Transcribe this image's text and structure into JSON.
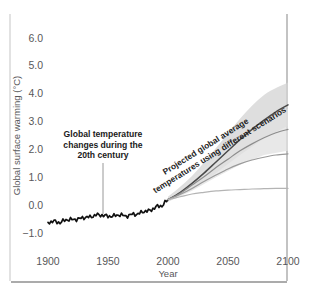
{
  "chart_data": {
    "type": "line",
    "title": "",
    "xlabel": "Year",
    "ylabel": "Global surface warming (°C)",
    "xlim": [
      1900,
      2100
    ],
    "ylim": [
      -1.0,
      6.0
    ],
    "xticks": [
      "1900",
      "1950",
      "2000",
      "2050",
      "2100"
    ],
    "yticks": [
      "6.0",
      "5.0",
      "4.0",
      "3.0",
      "2.0",
      "1.0",
      "0.0",
      "−1.0"
    ],
    "grid": false,
    "legend": "none",
    "annotations": [
      {
        "name": "historical-annotation",
        "line1": "Global temperature",
        "line2": "changes during the",
        "line3": "20th century",
        "pointer_year": 1945,
        "pointer_value": -0.35
      },
      {
        "name": "projection-annotation",
        "line1": "Projected global average",
        "line2": "temperatures using different scenarios",
        "rotation_deg": -32
      }
    ],
    "series": [
      {
        "name": "Observed 20th century",
        "color": "#111111",
        "width": 1.7,
        "x": [
          1900,
          1905,
          1910,
          1915,
          1920,
          1925,
          1930,
          1935,
          1940,
          1945,
          1950,
          1955,
          1960,
          1965,
          1970,
          1975,
          1980,
          1985,
          1990,
          1995,
          2000
        ],
        "values": [
          -0.62,
          -0.58,
          -0.63,
          -0.52,
          -0.52,
          -0.5,
          -0.44,
          -0.43,
          -0.35,
          -0.36,
          -0.4,
          -0.39,
          -0.34,
          -0.4,
          -0.33,
          -0.32,
          -0.22,
          -0.2,
          -0.06,
          -0.02,
          0.2
        ]
      },
      {
        "name": "High scenario (A2/A1FI)",
        "color": "#4a4a4a",
        "width": 1.5,
        "x": [
          2000,
          2010,
          2020,
          2030,
          2040,
          2050,
          2060,
          2070,
          2080,
          2090,
          2100
        ],
        "values": [
          0.2,
          0.45,
          0.78,
          1.15,
          1.55,
          1.95,
          2.35,
          2.72,
          3.05,
          3.35,
          3.6
        ]
      },
      {
        "name": "Mid-high scenario (A1B)",
        "color": "#8d8d8d",
        "width": 1.2,
        "x": [
          2000,
          2010,
          2020,
          2030,
          2040,
          2050,
          2060,
          2070,
          2080,
          2090,
          2100
        ],
        "values": [
          0.2,
          0.42,
          0.72,
          1.02,
          1.35,
          1.65,
          1.95,
          2.2,
          2.42,
          2.6,
          2.72
        ]
      },
      {
        "name": "Mid-low scenario (B1)",
        "color": "#9a9a9a",
        "width": 1.2,
        "x": [
          2000,
          2010,
          2020,
          2030,
          2040,
          2050,
          2060,
          2070,
          2080,
          2090,
          2100
        ],
        "values": [
          0.2,
          0.38,
          0.6,
          0.85,
          1.08,
          1.3,
          1.48,
          1.62,
          1.72,
          1.8,
          1.84
        ]
      },
      {
        "name": "Constant composition commitment",
        "color": "#b4b4b4",
        "width": 1.2,
        "x": [
          2000,
          2010,
          2020,
          2030,
          2040,
          2050,
          2060,
          2070,
          2080,
          2090,
          2100
        ],
        "values": [
          0.2,
          0.3,
          0.4,
          0.46,
          0.51,
          0.54,
          0.56,
          0.58,
          0.59,
          0.6,
          0.6
        ]
      }
    ],
    "uncertainty_bands": [
      {
        "name": "High scenario range",
        "color": "#d3d3d3",
        "x": [
          2000,
          2020,
          2040,
          2060,
          2080,
          2100
        ],
        "upper": [
          0.3,
          1.05,
          2.05,
          3.1,
          3.95,
          4.4
        ],
        "lower": [
          0.12,
          0.55,
          1.15,
          1.8,
          2.4,
          2.85
        ]
      },
      {
        "name": "Mid scenario range",
        "color": "#e0e0e0",
        "x": [
          2000,
          2020,
          2040,
          2060,
          2080,
          2100
        ],
        "upper": [
          0.28,
          0.92,
          1.72,
          2.5,
          3.1,
          3.45
        ],
        "lower": [
          0.12,
          0.52,
          1.0,
          1.45,
          1.8,
          1.95
        ]
      }
    ]
  }
}
